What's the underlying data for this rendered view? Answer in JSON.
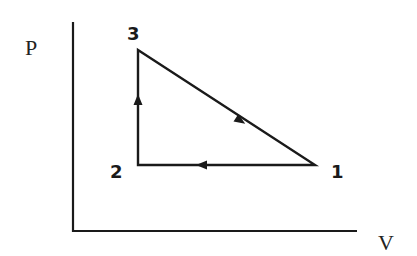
{
  "diagram": {
    "type": "pv-diagram",
    "axes": {
      "y_label": "P",
      "x_label": "V"
    },
    "points": [
      {
        "id": "1",
        "label": "1",
        "x": 315,
        "y": 165
      },
      {
        "id": "2",
        "label": "2",
        "x": 138,
        "y": 165
      },
      {
        "id": "3",
        "label": "3",
        "x": 138,
        "y": 50
      }
    ],
    "processes": [
      {
        "from": "1",
        "to": "2",
        "direction": "left",
        "description": "isobaric compression"
      },
      {
        "from": "2",
        "to": "3",
        "direction": "up",
        "description": "isochoric pressure increase"
      },
      {
        "from": "3",
        "to": "1",
        "direction": "down-right",
        "description": "expansion with pressure decrease"
      }
    ],
    "colors": {
      "line": "#1a1a1a",
      "background": "#ffffff"
    }
  }
}
